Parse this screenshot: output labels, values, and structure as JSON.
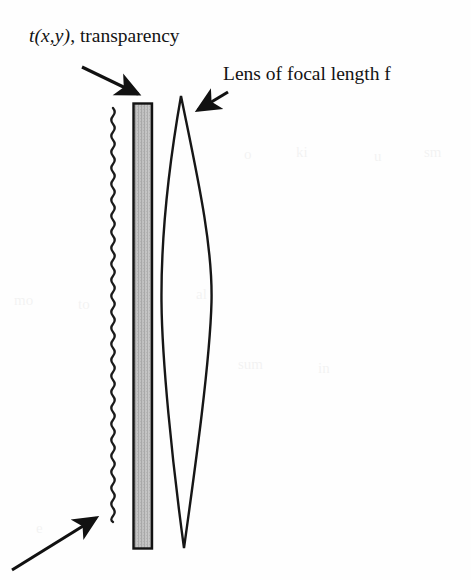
{
  "figure": {
    "background_color": "#fefefe",
    "ink_color": "#131313",
    "width": 471,
    "height": 580
  },
  "labels": {
    "transparency": {
      "symbol": "t(x,y)",
      "separator": ", ",
      "word": "transparency",
      "full": "t(x,y), transparency",
      "x": 29,
      "y": 26,
      "font_size": 19.5
    },
    "lens": {
      "text": "Lens of focal length f",
      "x": 223,
      "y": 64,
      "font_size": 19.5
    }
  },
  "arrows": [
    {
      "name": "arrow-to-transparency",
      "from_x": 82,
      "from_y": 67,
      "to_x": 143,
      "to_y": 97,
      "direction": "down-right",
      "points_at": "transparency"
    },
    {
      "name": "arrow-to-lens",
      "from_x": 228,
      "from_y": 92,
      "to_x": 193,
      "to_y": 113,
      "direction": "down-left",
      "points_at": "lens"
    },
    {
      "name": "arrow-to-wavefront",
      "from_x": 12,
      "from_y": 570,
      "to_x": 101,
      "to_y": 514,
      "direction": "up-right",
      "points_at": "wavefront"
    }
  ],
  "elements": {
    "wavefront": {
      "name": "wavy-wavefront-line",
      "x_center": 113,
      "y_top": 108,
      "y_bottom": 546,
      "amplitude": 3.2,
      "wavelength": 16,
      "stroke_width": 2.3,
      "color": "#1a1a1a"
    },
    "transparency_plate": {
      "name": "transparency-plate",
      "x_left": 133,
      "x_right": 152,
      "y_top": 103,
      "y_bottom": 549,
      "fill_color": "#b6b6b6",
      "border_color": "#121212",
      "border_width": 2.4,
      "hatch": "vertical-stipple"
    },
    "lens": {
      "name": "biconvex-lens",
      "apex_top_x": 181,
      "apex_top_y": 96,
      "apex_bottom_x": 184,
      "apex_bottom_y": 548,
      "widest_y": 300,
      "left_edge_x": 161,
      "right_edge_x": 212,
      "stroke_width": 2.4,
      "color": "#161616",
      "fill": "none"
    }
  },
  "ghost_artifacts": [
    {
      "text": "mo",
      "x": 14,
      "y": 292,
      "size": 15
    },
    {
      "text": "to",
      "x": 78,
      "y": 296,
      "size": 15
    },
    {
      "text": "al",
      "x": 196,
      "y": 286,
      "size": 15
    },
    {
      "text": "o",
      "x": 244,
      "y": 146,
      "size": 15
    },
    {
      "text": "ki",
      "x": 296,
      "y": 144,
      "size": 15
    },
    {
      "text": "u",
      "x": 374,
      "y": 148,
      "size": 15
    },
    {
      "text": "sm",
      "x": 424,
      "y": 144,
      "size": 15
    },
    {
      "text": "sum",
      "x": 238,
      "y": 356,
      "size": 15
    },
    {
      "text": "in",
      "x": 318,
      "y": 360,
      "size": 15
    },
    {
      "text": "e",
      "x": 36,
      "y": 520,
      "size": 15
    }
  ]
}
